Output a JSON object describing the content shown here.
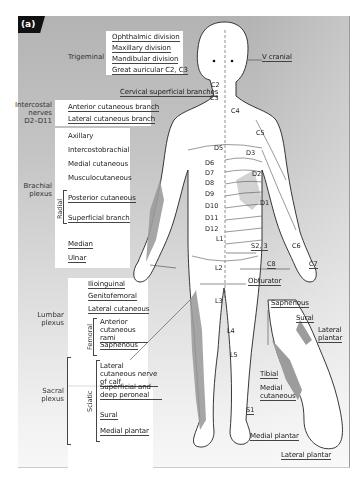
{
  "figure": {
    "badge": "(a)",
    "colors": {
      "panel_top": "#b3b3b3",
      "panel_bottom": "#f7f7f7",
      "nerve_shade": "#9a9a9a",
      "outline": "#222222",
      "label_box": "#ffffff"
    }
  },
  "head": {
    "group": "Trigeminal",
    "items": [
      "Ophthalmic division",
      "Maxillary division",
      "Mandibular division",
      "Great auricular C2, C3"
    ],
    "right_label": "V cranial",
    "cervical": "Cervical superficial branches"
  },
  "intercostal": {
    "group_lines": [
      "Intercostal",
      "nerves",
      "D2–D11"
    ],
    "items": [
      "Anterior cutaneous branch",
      "Lateral cutaneous branch"
    ]
  },
  "brachial": {
    "group_lines": [
      "Brachial",
      "plexus"
    ],
    "items": [
      "Axillary",
      "Intercostobrachial",
      "Medial cutaneous",
      "Musculocutaneous"
    ],
    "radial_label": "Radial",
    "radial_items": [
      "Posterior cutaneous",
      "Superficial branch"
    ],
    "tail_items": [
      "Median",
      "Ulnar"
    ]
  },
  "lumbar": {
    "group_lines": [
      "Lumbar",
      "plexus"
    ],
    "items": [
      "Ilioinguinal",
      "Genitofemoral",
      "Lateral cutaneous"
    ],
    "femoral_label": "Femoral",
    "femoral_items": [
      "Anterior cutaneous rami",
      "Saphenous"
    ]
  },
  "sacral": {
    "group_lines": [
      "Sacral",
      "plexus"
    ],
    "sciatic_label": "Sciatic",
    "sciatic_items": [
      "Lateral cutaneous nerve of calf",
      "Superficial and deep peroneal",
      "Sural",
      "Medial plantar"
    ]
  },
  "dermatomes": {
    "c2": "C2",
    "c3": "C3",
    "c4": "C4",
    "c5": "C5",
    "c6": "C6",
    "c7": "C7",
    "c8": "C8",
    "d1": "D1",
    "d2": "D2",
    "d3": "D3",
    "d5": "D5",
    "d6": "D6",
    "d7": "D7",
    "d8": "D8",
    "d9": "D9",
    "d10": "D10",
    "d11": "D11",
    "d12": "D12",
    "l1": "L1",
    "l2": "L2",
    "l3": "L3",
    "l4": "L4",
    "l5": "L5",
    "s1": "S1",
    "s23": "S2, 3"
  },
  "right_side": {
    "obturator": "Obturator"
  },
  "foot_inset": {
    "saphenous": "Saphenous",
    "sural": "Sural",
    "lateral_plantar_top": [
      "Lateral",
      "plantar"
    ],
    "tibial": "Tibial",
    "medial_cutaneous": [
      "Medial",
      "cutaneous"
    ],
    "medial_plantar": "Medial plantar",
    "lateral_plantar_bottom": "Lateral plantar"
  }
}
